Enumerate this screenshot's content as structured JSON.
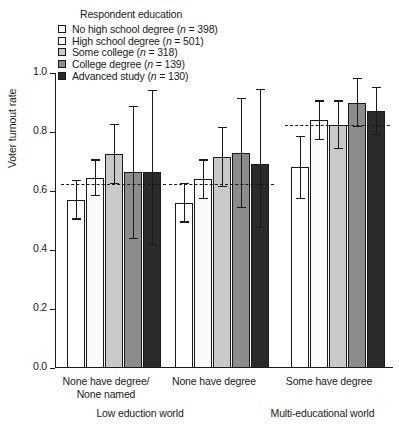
{
  "legend": {
    "title": "Respondent education",
    "items": [
      {
        "label": "No high school degree (",
        "n_prefix": "n",
        "n_text": " = 398)",
        "color": "#ffffff"
      },
      {
        "label": "High school degree (",
        "n_prefix": "n",
        "n_text": " = 501)",
        "color": "#fafafa"
      },
      {
        "label": "Some college (",
        "n_prefix": "n",
        "n_text": " = 318)",
        "color": "#c9c9c9"
      },
      {
        "label": "College degree (",
        "n_prefix": "n",
        "n_text": " = 139)",
        "color": "#8c8c8c"
      },
      {
        "label": "Advanced study (",
        "n_prefix": "n",
        "n_text": " = 130)",
        "color": "#2a2a2a"
      }
    ]
  },
  "axes": {
    "ylabel": "Voter turnout rate",
    "yticks": [
      "0.0",
      "0.2",
      "0.4",
      "0.6",
      "0.8",
      "1.0"
    ]
  },
  "captions": {
    "group1_line1": "None have degree/",
    "group1_line2": "None named",
    "group2_line1": "None have degree",
    "group3_line1": "Some have degree",
    "panel_left": "Low eduction world",
    "panel_right": "Multi-educational world"
  },
  "chart_data": {
    "type": "bar",
    "title": "",
    "xlabel": "",
    "ylabel": "Voter turnout rate",
    "ylim": [
      0.0,
      1.0
    ],
    "yticks": [
      0.0,
      0.2,
      0.4,
      0.6,
      0.8,
      1.0
    ],
    "grid": false,
    "legend_position": "top-left",
    "legend_title": "Respondent education",
    "categories": [
      "None have degree/None named",
      "None have degree",
      "Some have degree"
    ],
    "panels": [
      {
        "name": "Low eduction world",
        "categories": [
          "None have degree/None named",
          "None have degree"
        ]
      },
      {
        "name": "Multi-educational world",
        "categories": [
          "Some have degree"
        ]
      }
    ],
    "series": [
      {
        "name": "No high school degree (n = 398)",
        "n": 398,
        "color": "#ffffff",
        "values": [
          0.57,
          0.56,
          0.68
        ],
        "ci_low": [
          0.505,
          0.495,
          0.575
        ],
        "ci_high": [
          0.635,
          0.625,
          0.785
        ]
      },
      {
        "name": "High school degree (n = 501)",
        "n": 501,
        "color": "#fafafa",
        "values": [
          0.645,
          0.64,
          0.84
        ],
        "ci_low": [
          0.585,
          0.575,
          0.775
        ],
        "ci_high": [
          0.705,
          0.705,
          0.905
        ]
      },
      {
        "name": "Some college (n = 318)",
        "n": 318,
        "color": "#c9c9c9",
        "values": [
          0.725,
          0.715,
          0.825
        ],
        "ci_low": [
          0.625,
          0.615,
          0.745
        ],
        "ci_high": [
          0.825,
          0.815,
          0.905
        ]
      },
      {
        "name": "College degree (n = 139)",
        "n": 139,
        "color": "#8c8c8c",
        "values": [
          0.665,
          0.73,
          0.9
        ],
        "ci_low": [
          0.44,
          0.545,
          0.82
        ],
        "ci_high": [
          0.885,
          0.915,
          0.98
        ]
      },
      {
        "name": "Advanced study (n = 130)",
        "n": 130,
        "color": "#2a2a2a",
        "values": [
          0.665,
          0.69,
          0.87
        ],
        "ci_low": [
          0.42,
          0.475,
          0.79
        ],
        "ci_high": [
          0.94,
          0.945,
          0.95
        ]
      }
    ],
    "reference_lines": [
      {
        "category": "None have degree/None named",
        "value": 0.625,
        "style": "dashed"
      },
      {
        "category": "None have degree",
        "value": 0.625,
        "style": "dashed"
      },
      {
        "category": "Some have degree",
        "value": 0.825,
        "style": "dashed"
      }
    ]
  }
}
